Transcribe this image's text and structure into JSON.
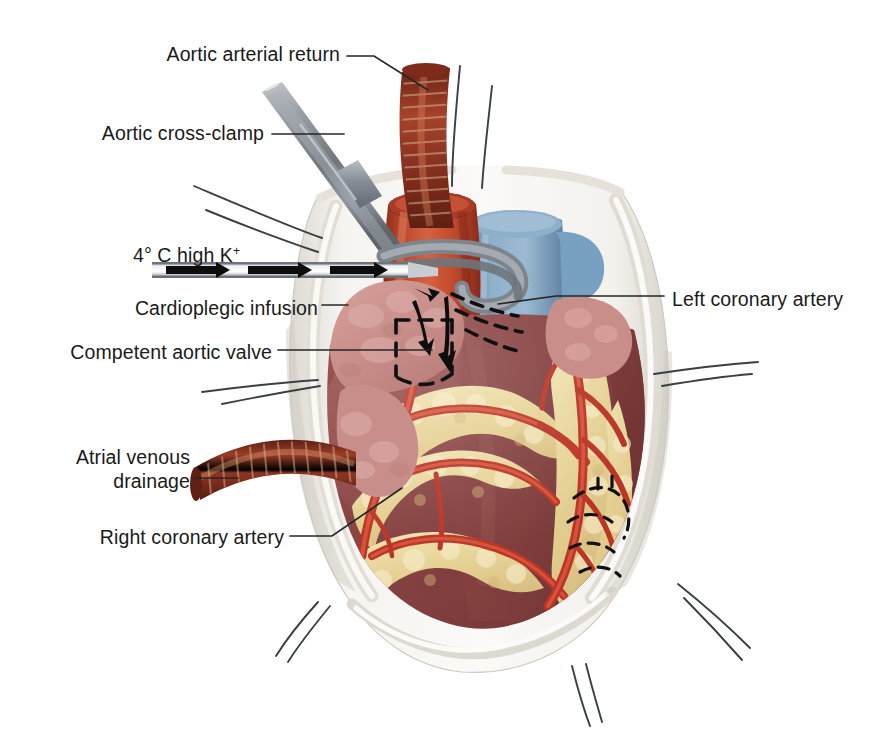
{
  "figure": {
    "domain": "medical-illustration"
  },
  "labels": [
    {
      "id": "aortic-arterial-return",
      "text": "Aortic arterial return",
      "align": "right",
      "x": 148,
      "y": 43
    },
    {
      "id": "aortic-cross-clamp",
      "text": "Aortic cross-clamp",
      "align": "right",
      "x": 84,
      "y": 122
    },
    {
      "id": "cardioplegia-solution",
      "text": "4° C high K",
      "superscript": "+",
      "align": "left",
      "x": 133,
      "y": 244
    },
    {
      "id": "cardioplegic-infusion",
      "text": "Cardioplegic infusion",
      "align": "right",
      "x": 78,
      "y": 297
    },
    {
      "id": "competent-aortic-valve",
      "text": "Competent aortic valve",
      "align": "right",
      "x": 43,
      "y": 341
    },
    {
      "id": "atrial-venous-drainage-line1",
      "text": "Atrial venous",
      "align": "right",
      "x": 78,
      "y": 446
    },
    {
      "id": "atrial-venous-drainage-line2",
      "text": "drainage",
      "align": "right",
      "x": 133,
      "y": 471
    },
    {
      "id": "right-coronary-artery",
      "text": "Right coronary artery",
      "align": "right",
      "x": 81,
      "y": 526
    },
    {
      "id": "left-coronary-artery",
      "text": "Left coronary artery",
      "align": "left",
      "x": 672,
      "y": 288
    }
  ],
  "leader_lines": [
    {
      "id": "leader-aortic-arterial-return",
      "points": "345,55 372,55 425,88"
    },
    {
      "id": "leader-aortic-cross-clamp",
      "points": "268,134 340,134"
    },
    {
      "id": "leader-cardioplegic-infusion",
      "points": "322,305 346,305"
    },
    {
      "id": "leader-competent-aortic-valve",
      "points": "276,350 430,350"
    },
    {
      "id": "leader-atrial-venous-drainage",
      "points": "192,478 236,478"
    },
    {
      "id": "leader-right-coronary-artery",
      "points": "288,536 330,536 400,490"
    },
    {
      "id": "leader-left-coronary-artery",
      "points": "660,296 560,296 497,305"
    }
  ],
  "anatomy": {
    "structures": [
      {
        "id": "pericardial-cradle",
        "label": "Pericardial cradle",
        "color": "#f2f0ec"
      },
      {
        "id": "ascending-aorta",
        "label": "Ascending aorta",
        "color": "#c0442e"
      },
      {
        "id": "pulmonary-artery",
        "label": "Pulmonary artery",
        "color": "#7d9ec0"
      },
      {
        "id": "right-atrium",
        "label": "Right atrium",
        "color": "#d49a96"
      },
      {
        "id": "left-atrial-appendage",
        "label": "Left atrial appendage",
        "color": "#c58e8a"
      },
      {
        "id": "right-ventricle-myocardium",
        "label": "Right ventricle myocardium",
        "color": "#8e4a49"
      },
      {
        "id": "left-ventricle-myocardium",
        "label": "Left ventricle myocardium",
        "color": "#8a4544"
      },
      {
        "id": "epicardial-fat",
        "label": "Epicardial fat",
        "color": "#e8d69a"
      },
      {
        "id": "coronary-vessels",
        "label": "Coronary vessels",
        "color": "#c0392b"
      }
    ]
  },
  "instruments": [
    {
      "id": "aortic-cross-clamp-instrument",
      "label": "Aortic cross-clamp",
      "color": "#8e9499"
    },
    {
      "id": "aortic-return-cannula",
      "label": "Aortic return cannula",
      "color": "#8c3322"
    },
    {
      "id": "cardioplegia-cannula",
      "label": "Cardioplegia cannula",
      "color": "#d8d8d8"
    },
    {
      "id": "venous-drainage-cannula",
      "label": "Atrial venous drainage cannula",
      "color": "#8c3322"
    }
  ],
  "annotations": {
    "flow_arrows": {
      "id": "cardioplegia-flow-arrows",
      "label": "Cardioplegia flow direction",
      "count": 4
    },
    "dashed_outlines": [
      {
        "id": "dashed-aortic-valve",
        "label": "Competent aortic valve (hidden)"
      },
      {
        "id": "dashed-left-coronary",
        "label": "Left coronary artery (hidden)"
      },
      {
        "id": "dashed-distal-coronary",
        "label": "Distal coronary lesion (hidden)"
      }
    ],
    "stay_sutures": {
      "id": "pericardial-stay-sutures",
      "label": "Pericardial stay sutures",
      "count": 6
    }
  },
  "colors": {
    "background": "#ffffff",
    "label_text": "#1a1a1a",
    "leader_line": "#262626",
    "pericardium": "#f4f2ee",
    "pericardium_shadow": "#d7d4cd",
    "aorta": "#c0442e",
    "pulmonary": "#7d9ec0",
    "myocardium": "#8a4544",
    "fat": "#e8d69a",
    "coronary": "#c0392b",
    "cannula_red": "#8c3322",
    "metal": "#8e9499",
    "dashed": "#111111"
  }
}
